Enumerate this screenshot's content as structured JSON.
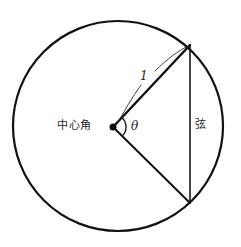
{
  "figure": {
    "background_color": "#ffffff",
    "stroke_color": "#111111",
    "canvas": {
      "width": 241,
      "height": 247
    }
  },
  "labels": {
    "central_angle": "中心角",
    "chord": "弦",
    "theta": "θ",
    "radius": "1"
  },
  "chart_data": {
    "type": "diagram",
    "elements": {
      "circle": {
        "name": "circle",
        "center_x": 118,
        "center_y": 126,
        "radius": 105,
        "stroke_width": 2.2,
        "fill": "none"
      },
      "center_point": {
        "name": "center-dot",
        "x": 113,
        "y": 127,
        "size": 7
      },
      "radius_upper": {
        "name": "radius-to-upper-chord-endpoint",
        "x1": 113,
        "y1": 127,
        "x2": 190,
        "y2": 45,
        "length_label": "1",
        "stroke_width": 2.4
      },
      "radius_lower": {
        "name": "radius-to-lower-chord-endpoint",
        "x1": 113,
        "y1": 127,
        "x2": 190,
        "y2": 203,
        "stroke_width": 2.0
      },
      "chord": {
        "name": "chord-line",
        "x1": 190,
        "y1": 45,
        "x2": 190,
        "y2": 203,
        "stroke_width": 1.6,
        "length_px": 158
      },
      "angle_arc": {
        "name": "central-angle-arc",
        "center_x": 113,
        "center_y": 127,
        "arc_radius": 13,
        "start_angle_deg": -46.8,
        "end_angle_deg": 44.6,
        "stroke_width": 1.4
      },
      "leader_upper": {
        "name": "leader-curve-to-radius-upper",
        "path": "M 155 71 C 168 58 180 50 188 46"
      },
      "leader_lower": {
        "name": "leader-curve-to-center",
        "path": "M 141 85 C 132 97 124 112 117 124"
      }
    },
    "annotations": [
      {
        "text": "中心角",
        "x": 57,
        "y": 120,
        "meaning": "central angle"
      },
      {
        "text": "θ",
        "x": 131,
        "y": 120,
        "meaning": "angle variable"
      },
      {
        "text": "1",
        "x": 140,
        "y": 70,
        "meaning": "radius length"
      },
      {
        "text": "弦",
        "x": 195,
        "y": 119,
        "meaning": "chord"
      }
    ]
  }
}
